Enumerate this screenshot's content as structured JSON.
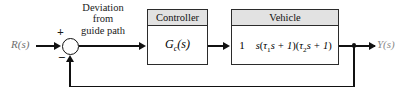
{
  "diagram": {
    "input_label": "R(s)",
    "output_label": "Y(s)",
    "annotation": {
      "line1": "Deviation",
      "line2": "from",
      "line3": "guide path"
    },
    "summing_junction": {
      "plus_sign": "+",
      "minus_sign": "−"
    },
    "blocks": [
      {
        "name": "controller",
        "header": "Controller",
        "transfer_function": "Gc(s)",
        "tf_base": "G",
        "tf_sub": "c",
        "tf_arg": "(s)"
      },
      {
        "name": "vehicle",
        "header": "Vehicle",
        "transfer_function": "1 / [s(τ₁s + 1)(τ₂s + 1)]",
        "numerator": "1",
        "den_s": "s",
        "den_open1": "(",
        "den_tau1": "τ",
        "den_tau1_sub": "1",
        "den_mid1": "s + 1",
        "den_close1": ")",
        "den_open2": "(",
        "den_tau2": "τ",
        "den_tau2_sub": "2",
        "den_mid2": "s + 1",
        "den_close2": ")"
      }
    ],
    "feedback": {
      "type": "unity",
      "gain": "1"
    },
    "colors": {
      "line": "#111111",
      "block_border": "#2b2b2b",
      "header_fill": "#e2e2e2",
      "background": "#ffffff",
      "signal_text": "#6e6e6e"
    }
  }
}
